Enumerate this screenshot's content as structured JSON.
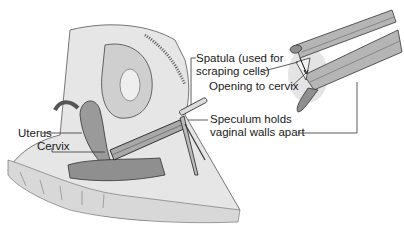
{
  "diagram": {
    "labels": {
      "spatula_line1": "Spatula (used for",
      "spatula_line2": "scraping cells)",
      "opening": "Opening to cervix",
      "speculum_line1": "Speculum holds",
      "speculum_line2": "vaginal walls apart",
      "uterus": "Uterus",
      "cervix": "Cervix"
    },
    "colors": {
      "background": "#ffffff",
      "tissue_light": "#e8e8e8",
      "tissue_mid": "#bdbdbd",
      "tissue_dark": "#8a8a8a",
      "outline": "#333333",
      "label_text": "#1a1a1a"
    }
  }
}
